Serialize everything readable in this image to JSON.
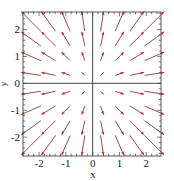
{
  "chart_data": {
    "type": "quiver",
    "title": "",
    "xlabel": "x",
    "ylabel": "y",
    "xlim": [
      -2.6,
      2.55
    ],
    "ylim": [
      -2.7,
      2.65
    ],
    "xticks": [
      -2,
      -1,
      0,
      1,
      2
    ],
    "yticks": [
      -2,
      -1,
      0,
      1,
      2
    ],
    "xtick_labels": [
      "-2",
      "-1",
      "0",
      "1",
      "2"
    ],
    "ytick_labels": [
      "-2",
      "-1",
      "0",
      "1",
      "2"
    ],
    "grid": false,
    "axes_lines_through_origin": true,
    "field": "F(x, y) = (x, y)",
    "field_description": "radial outward vector field",
    "grid_points_x": [
      -2.3,
      -1.65,
      -1.0,
      -0.35,
      0.35,
      1.0,
      1.65,
      2.3
    ],
    "grid_points_y": [
      -2.3,
      -1.65,
      -1.0,
      -0.35,
      0.35,
      1.0,
      1.65,
      2.3
    ],
    "arrow_scale": 0.32,
    "arrow_color": "#cc2b2b",
    "shaft_color": "#8a3a3a",
    "axis_color": "#333333"
  }
}
